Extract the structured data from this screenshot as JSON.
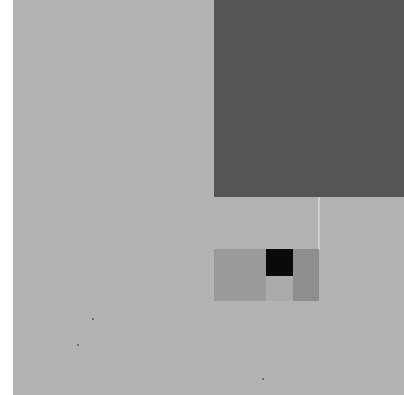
{
  "image": {
    "description": "Abstract minimalist composition of gray rectangles on a light gray textured ground",
    "width": 404,
    "height": 395
  },
  "colors": {
    "page_margin": "#ffffff",
    "background": "#b3b3b3",
    "dark_square": "#555555",
    "thin_line": "#cfcfcf",
    "panel_left": "#9a9a9a",
    "black_square": "#0a0a0a",
    "panel_under_black": "#ababab",
    "panel_right": "#8e8e8e",
    "speck": "#5a5a5a"
  },
  "shapes": [
    {
      "name": "dark-square",
      "x": 214,
      "y": 0,
      "w": 190,
      "h": 197
    },
    {
      "name": "thin-vertical-line",
      "x": 318,
      "y": 197,
      "w": 2,
      "h": 53
    },
    {
      "name": "panel-left-block",
      "x": 214,
      "y": 249,
      "w": 52,
      "h": 52
    },
    {
      "name": "black-square",
      "x": 266,
      "y": 249,
      "w": 27,
      "h": 27
    },
    {
      "name": "panel-under-black",
      "x": 266,
      "y": 276,
      "w": 27,
      "h": 25
    },
    {
      "name": "panel-right-block",
      "x": 293,
      "y": 249,
      "w": 26,
      "h": 52
    }
  ],
  "specks": [
    {
      "x": 92,
      "y": 318
    },
    {
      "x": 77,
      "y": 344
    },
    {
      "x": 262,
      "y": 378
    }
  ]
}
